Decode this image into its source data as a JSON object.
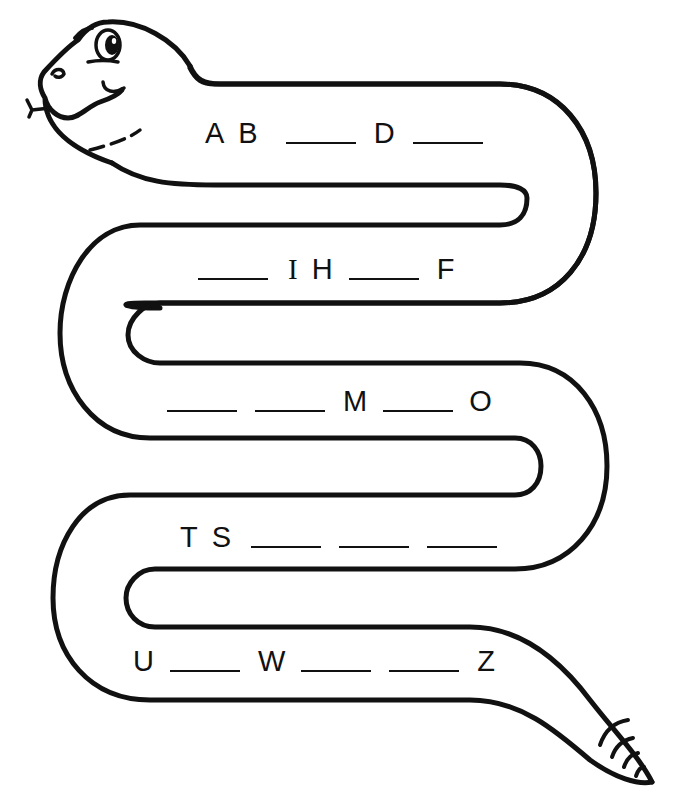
{
  "worksheet": {
    "title": "Alphabet Snake",
    "colors": {
      "ink": "#111111",
      "paper": "#ffffff"
    },
    "rows": [
      {
        "id": "row-1",
        "items": [
          {
            "type": "letter",
            "value": "A"
          },
          {
            "type": "letter",
            "value": "B"
          },
          {
            "type": "blank",
            "answer_hidden": true
          },
          {
            "type": "letter",
            "value": "D"
          },
          {
            "type": "blank",
            "answer_hidden": true
          }
        ]
      },
      {
        "id": "row-2",
        "items": [
          {
            "type": "blank",
            "answer_hidden": true
          },
          {
            "type": "letter",
            "value": "I"
          },
          {
            "type": "letter",
            "value": "H"
          },
          {
            "type": "blank",
            "answer_hidden": true
          },
          {
            "type": "letter",
            "value": "F"
          }
        ]
      },
      {
        "id": "row-3",
        "items": [
          {
            "type": "blank",
            "answer_hidden": true
          },
          {
            "type": "blank",
            "answer_hidden": true
          },
          {
            "type": "letter",
            "value": "M"
          },
          {
            "type": "blank",
            "answer_hidden": true
          },
          {
            "type": "letter",
            "value": "O"
          }
        ]
      },
      {
        "id": "row-4",
        "items": [
          {
            "type": "letter",
            "value": "T"
          },
          {
            "type": "letter",
            "value": "S"
          },
          {
            "type": "blank",
            "answer_hidden": true
          },
          {
            "type": "blank",
            "answer_hidden": true
          },
          {
            "type": "blank",
            "answer_hidden": true
          }
        ]
      },
      {
        "id": "row-5",
        "items": [
          {
            "type": "letter",
            "value": "U"
          },
          {
            "type": "blank",
            "answer_hidden": true
          },
          {
            "type": "letter",
            "value": "W"
          },
          {
            "type": "blank",
            "answer_hidden": true
          },
          {
            "type": "blank",
            "answer_hidden": true
          },
          {
            "type": "letter",
            "value": "Z"
          }
        ]
      }
    ],
    "labels": {
      "r1": [
        "A",
        "B",
        "D"
      ],
      "r2": [
        "I",
        "H",
        "F"
      ],
      "r3": [
        "M",
        "O"
      ],
      "r4": [
        "T",
        "S"
      ],
      "r5": [
        "U",
        "W",
        "Z"
      ]
    }
  }
}
